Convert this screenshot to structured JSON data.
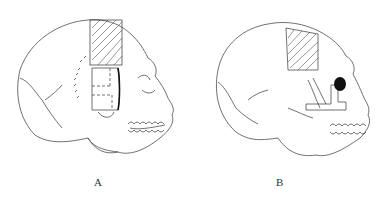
{
  "figures": [
    {
      "label": "A",
      "description": "Lateral skull with hatched parietal graft site and rectangular temporal/zygomatic region with dashed segment lines"
    },
    {
      "label": "B",
      "description": "Lateral skull with hatched parietal graft site and L-shaped orbital/zygomatic graft with darkened orbit"
    }
  ],
  "colors": {
    "line": "#333333",
    "background": "#ffffff",
    "fill": "#111111"
  }
}
